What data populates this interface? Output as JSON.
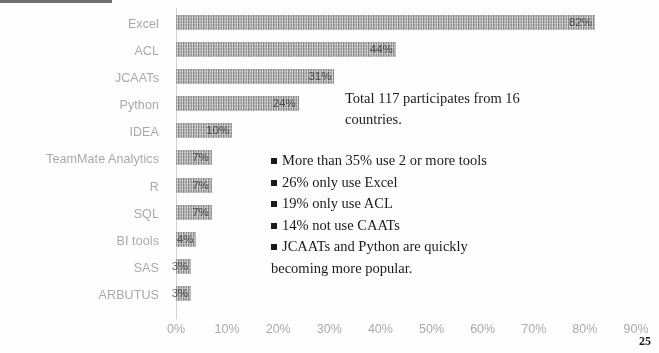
{
  "chart_data": {
    "type": "bar",
    "orientation": "horizontal",
    "title": "",
    "xlabel": "",
    "ylabel": "",
    "xlim": [
      0,
      90
    ],
    "grid": false,
    "legend": "none",
    "categories": [
      "Excel",
      "ACL",
      "JCAATs",
      "Python",
      "IDEA",
      "TeamMate Analytics",
      "R",
      "SQL",
      "BI tools",
      "SAS",
      "ARBUTUS"
    ],
    "values": [
      82,
      43,
      31,
      24,
      11,
      7,
      7,
      7,
      4,
      3,
      3
    ],
    "value_labels": [
      "82%",
      "44%",
      "31%",
      "24%",
      "10%",
      "7%",
      "7%",
      "7%",
      "4%",
      "3%",
      "3%"
    ],
    "tick_labels": [
      "0%",
      "10%",
      "20%",
      "30%",
      "40%",
      "50%",
      "60%",
      "70%",
      "80%",
      "90%"
    ],
    "tick_values": [
      0,
      10,
      20,
      30,
      40,
      50,
      60,
      70,
      80,
      90
    ],
    "bar_color": "#9a9a9a",
    "label_color": "#a9a9a9"
  },
  "annotation": {
    "summary_line1": "Total 117 participates from 16",
    "summary_line2": "countries."
  },
  "bullets": [
    {
      "text": "More than 35% use 2 or more tools",
      "continuation": ""
    },
    {
      "text": "26% only use Excel",
      "continuation": ""
    },
    {
      "text": "19% only use ACL",
      "continuation": ""
    },
    {
      "text": "14% not use CAATs",
      "continuation": ""
    },
    {
      "text": "JCAATs and Python are quickly",
      "continuation": "becoming more popular."
    }
  ],
  "footer": {
    "page_number": "25"
  }
}
